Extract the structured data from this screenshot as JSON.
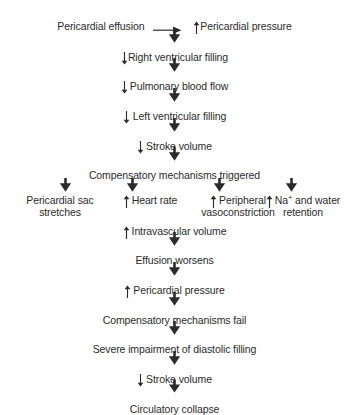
{
  "diagram": {
    "ink_color": "#2b2b2b",
    "background_color": "#ffffff",
    "arrow_down_glyph": "down-arrow",
    "arrow_right_glyph": "right-arrow",
    "increase_glyph": "up-arrow-small",
    "decrease_glyph": "down-arrow-small"
  },
  "start": {
    "label": "Pericardial effusion",
    "connector": "→"
  },
  "chain_upper": [
    {
      "marker": "up",
      "label": "Pericardial pressure"
    },
    {
      "marker": "down",
      "label": "Right ventricular filling"
    },
    {
      "marker": "down",
      "label": "Pulmonary blood flow"
    },
    {
      "marker": "down",
      "label": "Left ventricular filling"
    },
    {
      "marker": "down",
      "label": "Stroke volume"
    },
    {
      "marker": "none",
      "label": "Compensatory mechanisms triggered"
    }
  ],
  "branches": [
    {
      "marker": "none",
      "line1": "Pericardial sac",
      "line2": "stretches"
    },
    {
      "marker": "up",
      "line1": "Heart rate",
      "line2": ""
    },
    {
      "marker": "up",
      "line1": "Peripheral",
      "line2": "vasoconstriction"
    },
    {
      "marker": "up",
      "line1": "Na",
      "sup": "+",
      "line1_rest": " and water",
      "line2": "retention"
    }
  ],
  "chain_lower": [
    {
      "marker": "up",
      "label": "Intravascular volume"
    },
    {
      "marker": "none",
      "label": "Effusion worsens"
    },
    {
      "marker": "up",
      "label": "Pericardial pressure"
    },
    {
      "marker": "none",
      "label": "Compensatory mechanisms fail"
    },
    {
      "marker": "none",
      "label": "Severe impairment of diastolic filling"
    },
    {
      "marker": "down",
      "label": "Stroke volume"
    },
    {
      "marker": "none",
      "label": "Circulatory collapse"
    }
  ]
}
